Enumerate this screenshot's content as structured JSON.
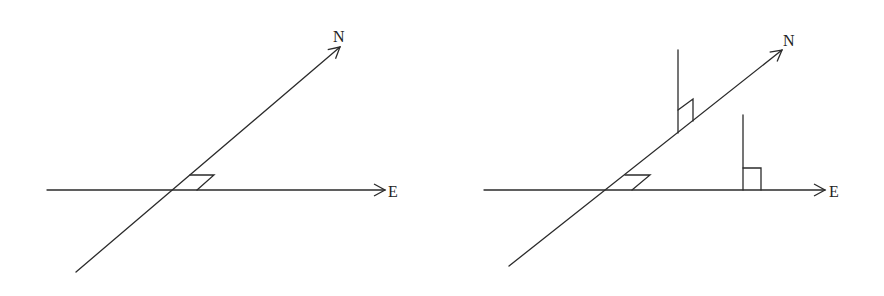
{
  "colors": {
    "stroke": "#2b2b2b",
    "text": "#222222",
    "background": "#ffffff"
  },
  "diagrams": [
    {
      "name": "left",
      "labels": {
        "north": "N",
        "east": "E"
      },
      "east_axis": {
        "x1": 47,
        "y1": 190,
        "x2": 385,
        "y2": 190
      },
      "north_axis": {
        "x1": 76,
        "y1": 272,
        "x2": 340,
        "y2": 47
      },
      "angle_marker": "190,175 214,175 197,190",
      "north_label_pos": {
        "x": 333,
        "y": 42
      },
      "east_label_pos": {
        "x": 388,
        "y": 197
      }
    },
    {
      "name": "right",
      "labels": {
        "north": "N",
        "east": "E"
      },
      "east_axis": {
        "x1": 484,
        "y1": 190,
        "x2": 825,
        "y2": 190
      },
      "north_axis": {
        "x1": 509,
        "y1": 266,
        "x2": 782,
        "y2": 50
      },
      "angle_marker": "625,175 650,175 632,190",
      "north_label_pos": {
        "x": 783,
        "y": 46
      },
      "east_label_pos": {
        "x": 829,
        "y": 197
      },
      "perpendiculars": [
        {
          "line": {
            "x1": 678,
            "y1": 50,
            "x2": 678,
            "y2": 133
          },
          "marker": "678,110 693,99 693,121"
        },
        {
          "line": {
            "x1": 743,
            "y1": 115,
            "x2": 743,
            "y2": 190
          },
          "marker": "743,168 761,168 761,190"
        }
      ]
    }
  ]
}
